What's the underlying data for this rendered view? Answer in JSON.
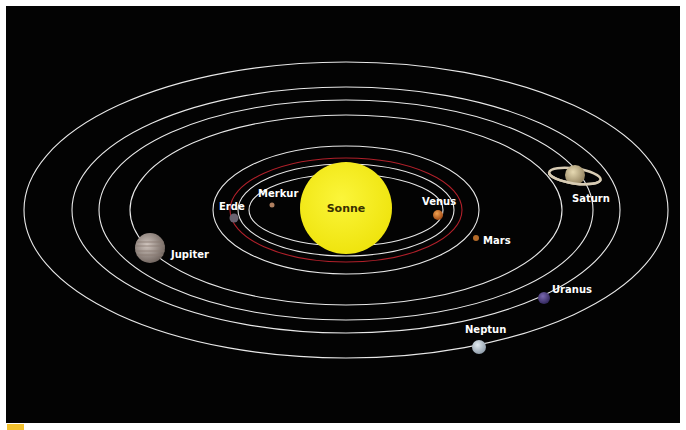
{
  "diagram": {
    "title": "",
    "background": "#030303",
    "center": {
      "x": 346,
      "y": 210
    },
    "sun": {
      "label": "Sonne",
      "color": "#f7ef1c",
      "cx": 346,
      "cy": 208,
      "r": 46
    },
    "orbits": [
      {
        "name": "Merkur",
        "rx": 97,
        "ry": 36,
        "color": "#e8e8e8"
      },
      {
        "name": "Venus",
        "rx": 108,
        "ry": 46,
        "color": "#e8e8e8"
      },
      {
        "name": "Erde",
        "rx": 116,
        "ry": 52,
        "color": "#b0202a"
      },
      {
        "name": "Mars",
        "rx": 133,
        "ry": 64,
        "color": "#e8e8e8"
      },
      {
        "name": "Jupiter",
        "rx": 216,
        "ry": 95,
        "color": "#e8e8e8"
      },
      {
        "name": "Saturn",
        "rx": 247,
        "ry": 110,
        "color": "#e8e8e8"
      },
      {
        "name": "Uranus",
        "rx": 274,
        "ry": 123,
        "color": "#e8e8e8"
      },
      {
        "name": "Neptun",
        "rx": 322,
        "ry": 148,
        "color": "#e8e8e8"
      }
    ],
    "planets": [
      {
        "label": "Merkur",
        "cx": 272,
        "cy": 205,
        "r": 2.5,
        "color": "#b08060",
        "lx": 258,
        "ly": 197
      },
      {
        "label": "Erde",
        "cx": 234,
        "cy": 218,
        "r": 4.5,
        "color": "#6a6270",
        "lx": 219,
        "ly": 210
      },
      {
        "label": "Venus",
        "cx": 438,
        "cy": 215,
        "r": 5,
        "color": "#c8641e",
        "lx": 422,
        "ly": 205
      },
      {
        "label": "Mars",
        "cx": 476,
        "cy": 238,
        "r": 3,
        "color": "#b46a28",
        "lx": 483,
        "ly": 244
      },
      {
        "label": "Jupiter",
        "cx": 150,
        "cy": 248,
        "r": 15,
        "color": "#a89a92",
        "lx": 171,
        "ly": 258
      },
      {
        "label": "Saturn",
        "cx": 575,
        "cy": 175,
        "r": 10,
        "color": "#c8b890",
        "lx": 572,
        "ly": 202
      },
      {
        "label": "Uranus",
        "cx": 544,
        "cy": 298,
        "r": 6,
        "color": "#4a3a7a",
        "lx": 552,
        "ly": 293
      },
      {
        "label": "Neptun",
        "cx": 479,
        "cy": 347,
        "r": 7,
        "color": "#b8c4d0",
        "lx": 465,
        "ly": 333
      }
    ]
  }
}
